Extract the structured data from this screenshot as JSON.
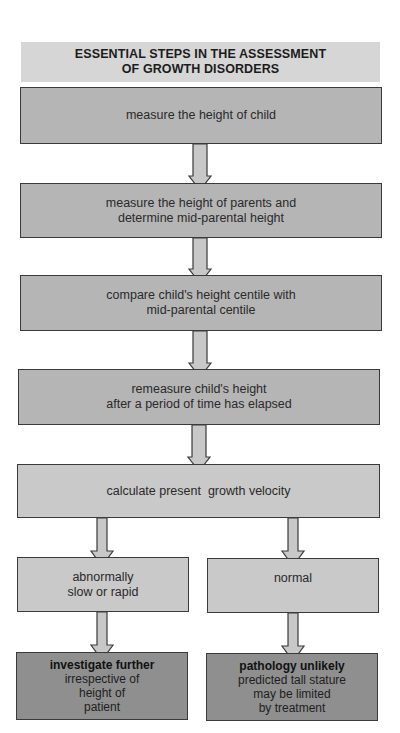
{
  "title": {
    "line1": "ESSENTIAL STEPS IN THE ASSESSMENT",
    "line2": "OF GROWTH DISORDERS"
  },
  "steps": [
    {
      "lines": [
        "measure the height of child"
      ]
    },
    {
      "lines": [
        "measure the height of parents and",
        "determine mid-parental height"
      ]
    },
    {
      "lines": [
        "compare child's height centile with",
        "mid-parental centile"
      ]
    },
    {
      "lines": [
        "remeasure child's height",
        "after a period of time has elapsed"
      ]
    },
    {
      "lines": [
        "calculate present  growth velocity"
      ]
    }
  ],
  "branches": {
    "left": {
      "condition": [
        "abnormally",
        "slow or rapid"
      ],
      "outcome_title": "investigate further",
      "outcome_lines": [
        "irrespective of",
        "height of",
        "patient"
      ]
    },
    "right": {
      "condition": [
        "normal"
      ],
      "outcome_title": "pathology unlikely",
      "outcome_lines": [
        "predicted tall stature",
        "may be limited",
        "by treatment"
      ]
    }
  },
  "colors": {
    "title_bg": "#d6d6d6",
    "step_bg": "#b5b5b5",
    "velocity_bg": "#c9c9c9",
    "outcome_bg": "#8f8f8f",
    "arrow_fill": "#c8c8c8",
    "border": "#3a3a3a"
  }
}
